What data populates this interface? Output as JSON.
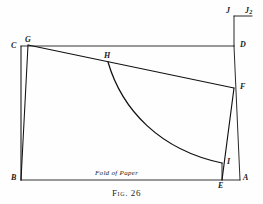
{
  "figure": {
    "caption": "Fig. 26",
    "fold_label": "Fold of Paper",
    "stroke_color": "#111111",
    "background_color": "#fefefe",
    "width": 263,
    "height": 204,
    "points": [
      {
        "id": "C",
        "label": "C",
        "x": 21,
        "y": 46,
        "label_x": 11,
        "label_y": 42
      },
      {
        "id": "G",
        "label": "G",
        "x": 28,
        "y": 45,
        "label_x": 25,
        "label_y": 36
      },
      {
        "id": "B",
        "label": "B",
        "x": 21,
        "y": 180,
        "label_x": 11,
        "label_y": 176
      },
      {
        "id": "H",
        "label": "H",
        "x": 108,
        "y": 62,
        "label_x": 104,
        "label_y": 53
      },
      {
        "id": "D",
        "label": "D",
        "x": 234,
        "y": 46,
        "label_x": 240,
        "label_y": 42
      },
      {
        "id": "F",
        "label": "F",
        "x": 234,
        "y": 88,
        "label_x": 240,
        "label_y": 84
      },
      {
        "id": "I",
        "label": "I",
        "x": 222,
        "y": 163,
        "label_x": 227,
        "label_y": 160
      },
      {
        "id": "E",
        "label": "E",
        "x": 222,
        "y": 180,
        "label_x": 219,
        "label_y": 184
      },
      {
        "id": "A",
        "label": "A",
        "x": 240,
        "y": 180,
        "label_x": 243,
        "label_y": 176
      },
      {
        "id": "J",
        "label": "J",
        "x": 234,
        "y": 16,
        "label_x": 227,
        "label_y": 9
      },
      {
        "id": "J2",
        "label": "J",
        "sub": "2",
        "x": 252,
        "y": 16,
        "label_x": 246,
        "label_y": 9
      }
    ],
    "segments": [
      {
        "name": "segment-C-B",
        "from": "C",
        "to": "B"
      },
      {
        "name": "segment-G-B",
        "from": "G",
        "to": "B"
      },
      {
        "name": "segment-C-D",
        "from": "C",
        "to": "D"
      },
      {
        "name": "segment-G-F",
        "from": "G",
        "to": "F"
      },
      {
        "name": "segment-B-A",
        "from": "B",
        "to": "A"
      },
      {
        "name": "segment-D-A",
        "from": "D",
        "to": "A"
      },
      {
        "name": "segment-F-E",
        "from": "F",
        "to": "E"
      },
      {
        "name": "segment-I-E",
        "from": "I",
        "to": "E"
      },
      {
        "name": "segment-J-D",
        "from": "J",
        "to": "D"
      },
      {
        "name": "segment-J-J2",
        "from": "J",
        "to": "J2"
      }
    ],
    "arc": {
      "name": "arc-H-I",
      "from": "H",
      "to": "I",
      "description": "concave curve from H down to I"
    }
  }
}
